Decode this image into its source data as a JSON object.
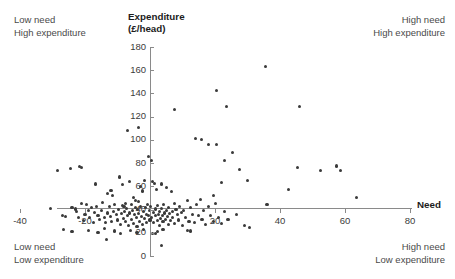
{
  "chart_data": {
    "type": "scatter",
    "title": "",
    "xlabel": "Need",
    "ylabel": "Expenditure (£/head)",
    "ylabel_line1": "Expenditure",
    "ylabel_line2": "(£/head)",
    "xlim": [
      -40,
      80
    ],
    "ylim": [
      0,
      180
    ],
    "xticks": [
      -40,
      -20,
      0,
      20,
      40,
      60,
      80
    ],
    "yticks": [
      0,
      20,
      40,
      60,
      80,
      100,
      120,
      140,
      160,
      180
    ],
    "xtick_labels": [
      "-40",
      "-20",
      "0",
      "20",
      "40",
      "60",
      "80"
    ],
    "ytick_labels": [
      "0",
      "20",
      "40",
      "60",
      "80",
      "100",
      "120",
      "140",
      "160",
      "180"
    ],
    "grid": false,
    "legend": "none",
    "point_color": "#3a3a3a",
    "axis_color": "#8a8a8a",
    "x_axis_crosses_y_at": 48,
    "annotations": [
      {
        "position": "top-left",
        "line1": "Low need",
        "line2": "High expenditure"
      },
      {
        "position": "top-right",
        "line1": "High need",
        "line2": "High expenditure"
      },
      {
        "position": "bottom-left",
        "line1": "Low need",
        "line2": "Low expenditure"
      },
      {
        "position": "bottom-right",
        "line1": "High need",
        "line2": "Low expenditure"
      }
    ],
    "points": [
      [
        -28.4,
        73.5
      ],
      [
        -24.5,
        75.2
      ],
      [
        -21.6,
        77.0
      ],
      [
        -21.2,
        76.2
      ],
      [
        -16.8,
        62.0
      ],
      [
        -13.2,
        53.5
      ],
      [
        -12.0,
        56.5
      ],
      [
        -11.4,
        52.0
      ],
      [
        -9.4,
        68.0
      ],
      [
        -8.6,
        61.5
      ],
      [
        -8.0,
        43.0
      ],
      [
        -7.6,
        45.5
      ],
      [
        -7.0,
        108.0
      ],
      [
        -6.4,
        64.0
      ],
      [
        -5.0,
        50.5
      ],
      [
        -4.4,
        48.0
      ],
      [
        -3.6,
        47.0
      ],
      [
        -2.8,
        59.5
      ],
      [
        -2.2,
        56.0
      ],
      [
        -1.8,
        65.0
      ],
      [
        -0.6,
        85.5
      ],
      [
        0.4,
        82.0
      ],
      [
        0.8,
        64.0
      ],
      [
        1.4,
        62.5
      ],
      [
        2.0,
        57.0
      ],
      [
        3.6,
        62.0
      ],
      [
        5.2,
        59.0
      ],
      [
        6.6,
        55.5
      ],
      [
        -30.5,
        41.0
      ],
      [
        -27.0,
        34.5
      ],
      [
        -26.0,
        34.0
      ],
      [
        -24.0,
        42.0
      ],
      [
        -23.0,
        40.5
      ],
      [
        -22.5,
        38.0
      ],
      [
        -22.0,
        33.5
      ],
      [
        -21.0,
        45.5
      ],
      [
        -20.5,
        30.5
      ],
      [
        -20.0,
        36.0
      ],
      [
        -19.5,
        44.0
      ],
      [
        -19.0,
        39.0
      ],
      [
        -18.6,
        33.0
      ],
      [
        -18.0,
        41.5
      ],
      [
        -17.4,
        28.5
      ],
      [
        -17.0,
        37.5
      ],
      [
        -16.4,
        43.0
      ],
      [
        -16.0,
        35.0
      ],
      [
        -15.5,
        31.5
      ],
      [
        -15.0,
        39.5
      ],
      [
        -14.6,
        46.0
      ],
      [
        -14.0,
        33.5
      ],
      [
        -13.6,
        29.0
      ],
      [
        -13.0,
        37.0
      ],
      [
        -12.6,
        42.5
      ],
      [
        -12.2,
        34.0
      ],
      [
        -11.8,
        30.0
      ],
      [
        -11.2,
        38.5
      ],
      [
        -10.8,
        44.0
      ],
      [
        -10.4,
        35.5
      ],
      [
        -10.0,
        31.0
      ],
      [
        -9.6,
        40.0
      ],
      [
        -9.2,
        27.5
      ],
      [
        -8.8,
        36.5
      ],
      [
        -8.4,
        43.5
      ],
      [
        -8.2,
        32.0
      ],
      [
        -7.8,
        38.0
      ],
      [
        -7.4,
        29.5
      ],
      [
        -7.2,
        41.0
      ],
      [
        -6.8,
        34.5
      ],
      [
        -6.6,
        26.5
      ],
      [
        -6.2,
        37.0
      ],
      [
        -5.8,
        44.5
      ],
      [
        -5.6,
        31.5
      ],
      [
        -5.4,
        39.0
      ],
      [
        -5.2,
        28.0
      ],
      [
        -4.8,
        35.5
      ],
      [
        -4.6,
        42.0
      ],
      [
        -4.2,
        33.0
      ],
      [
        -4.0,
        25.5
      ],
      [
        -3.8,
        40.0
      ],
      [
        -3.4,
        36.5
      ],
      [
        -3.2,
        30.0
      ],
      [
        -3.0,
        43.0
      ],
      [
        -2.6,
        34.0
      ],
      [
        -2.4,
        27.0
      ],
      [
        -2.0,
        38.5
      ],
      [
        -1.6,
        32.5
      ],
      [
        -1.4,
        41.5
      ],
      [
        -1.2,
        36.0
      ],
      [
        -1.0,
        29.0
      ],
      [
        -0.8,
        44.0
      ],
      [
        -0.4,
        35.0
      ],
      [
        -0.2,
        39.5
      ],
      [
        0.0,
        31.0
      ],
      [
        0.2,
        42.5
      ],
      [
        0.6,
        33.5
      ],
      [
        1.0,
        37.5
      ],
      [
        1.2,
        28.5
      ],
      [
        1.6,
        40.5
      ],
      [
        1.8,
        34.5
      ],
      [
        2.2,
        30.5
      ],
      [
        2.4,
        43.5
      ],
      [
        2.6,
        36.0
      ],
      [
        2.8,
        26.0
      ],
      [
        3.0,
        38.0
      ],
      [
        3.2,
        32.0
      ],
      [
        3.4,
        41.0
      ],
      [
        3.8,
        35.0
      ],
      [
        4.0,
        29.5
      ],
      [
        4.2,
        44.5
      ],
      [
        4.4,
        37.0
      ],
      [
        4.8,
        31.5
      ],
      [
        5.0,
        39.0
      ],
      [
        5.4,
        34.0
      ],
      [
        5.6,
        27.5
      ],
      [
        5.8,
        42.0
      ],
      [
        6.0,
        36.5
      ],
      [
        6.2,
        30.5
      ],
      [
        6.8,
        38.5
      ],
      [
        7.0,
        33.0
      ],
      [
        7.4,
        45.0
      ],
      [
        7.6,
        28.0
      ],
      [
        8.0,
        40.0
      ],
      [
        8.4,
        35.5
      ],
      [
        8.8,
        31.0
      ],
      [
        9.2,
        43.0
      ],
      [
        9.6,
        37.5
      ],
      [
        10.0,
        26.5
      ],
      [
        10.4,
        39.0
      ],
      [
        11.0,
        33.5
      ],
      [
        11.6,
        47.5
      ],
      [
        12.0,
        30.0
      ],
      [
        12.6,
        41.5
      ],
      [
        13.0,
        36.0
      ],
      [
        13.6,
        28.5
      ],
      [
        14.2,
        44.0
      ],
      [
        14.8,
        34.5
      ],
      [
        15.4,
        48.5
      ],
      [
        16.0,
        31.5
      ],
      [
        16.6,
        39.5
      ],
      [
        17.2,
        27.0
      ],
      [
        18.0,
        42.5
      ],
      [
        18.6,
        35.0
      ],
      [
        19.4,
        30.0
      ],
      [
        20.2,
        45.0
      ],
      [
        21.0,
        33.0
      ],
      [
        22.0,
        28.0
      ],
      [
        23.0,
        38.0
      ],
      [
        24.0,
        31.5
      ],
      [
        -26.5,
        22.5
      ],
      [
        -24.0,
        21.0
      ],
      [
        -19.0,
        22.0
      ],
      [
        -16.0,
        20.5
      ],
      [
        -14.0,
        23.5
      ],
      [
        -11.0,
        21.5
      ],
      [
        -9.0,
        19.5
      ],
      [
        -6.0,
        22.0
      ],
      [
        -4.0,
        20.0
      ],
      [
        -2.0,
        23.0
      ],
      [
        0.8,
        19.0
      ],
      [
        1.6,
        19.5
      ],
      [
        2.4,
        21.0
      ],
      [
        4.0,
        22.5
      ],
      [
        11.5,
        22.0
      ],
      [
        12.5,
        21.5
      ],
      [
        -13.5,
        14.5
      ],
      [
        3.5,
        9.0
      ],
      [
        -3.5,
        111.0
      ],
      [
        7.5,
        126.5
      ],
      [
        20.5,
        142.5
      ],
      [
        23.5,
        129.0
      ],
      [
        35.5,
        163.5
      ],
      [
        46.0,
        129.0
      ],
      [
        14.0,
        101.5
      ],
      [
        15.8,
        100.0
      ],
      [
        18.0,
        96.0
      ],
      [
        20.5,
        96.0
      ],
      [
        23.0,
        82.0
      ],
      [
        25.5,
        89.5
      ],
      [
        22.0,
        63.0
      ],
      [
        30.0,
        65.0
      ],
      [
        27.5,
        74.5
      ],
      [
        29.0,
        26.5
      ],
      [
        30.5,
        24.5
      ],
      [
        36.0,
        44.0
      ],
      [
        42.5,
        57.5
      ],
      [
        45.5,
        76.5
      ],
      [
        52.5,
        74.0
      ],
      [
        57.5,
        77.5
      ],
      [
        58.5,
        73.5
      ],
      [
        63.5,
        50.0
      ],
      [
        26.5,
        35.5
      ],
      [
        19.5,
        52.0
      ]
    ]
  },
  "axis": {
    "y_title_line1": "Expenditure",
    "y_title_line2": "(£/head)",
    "x_title": "Need"
  },
  "corners": {
    "top_left": {
      "line1": "Low need",
      "line2": "High expenditure"
    },
    "top_right": {
      "line1": "High need",
      "line2": "High expenditure"
    },
    "bottom_left": {
      "line1": "Low need",
      "line2": "Low expenditure"
    },
    "bottom_right": {
      "line1": "High need",
      "line2": "Low expenditure"
    }
  }
}
